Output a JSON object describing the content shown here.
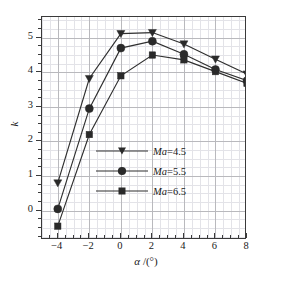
{
  "chart_data": {
    "type": "line",
    "title": "",
    "xlabel": "α /(°)",
    "ylabel": "k",
    "xlim": [
      -5,
      8
    ],
    "ylim": [
      -0.85,
      5.6
    ],
    "xticks": [
      -4,
      -2,
      0,
      2,
      4,
      6,
      8
    ],
    "xticklabels": [
      "−4",
      "−2",
      "0",
      "2",
      "4",
      "6",
      "8"
    ],
    "yticks": [
      0,
      1,
      2,
      3,
      4,
      5
    ],
    "yticklabels": [
      "0",
      "1",
      "2",
      "3",
      "4",
      "5"
    ],
    "grid": true,
    "minor_grid": true,
    "legend_position": "center-right",
    "x": [
      -4,
      -2,
      0,
      2,
      4,
      6,
      8
    ],
    "series": [
      {
        "name": "Ma=4.5",
        "label_prefix": "Ma",
        "label_value": "=4.5",
        "marker": "triangle-down",
        "values": [
          0.8,
          3.82,
          5.12,
          5.15,
          4.82,
          4.38,
          3.95
        ]
      },
      {
        "name": "Ma=5.5",
        "label_prefix": "Ma",
        "label_value": "=5.5",
        "marker": "circle",
        "values": [
          0.05,
          2.95,
          4.7,
          4.9,
          4.52,
          4.08,
          3.76
        ]
      },
      {
        "name": "Ma=6.5",
        "label_prefix": "Ma",
        "label_value": "=6.5",
        "marker": "square",
        "values": [
          -0.45,
          2.2,
          3.9,
          4.5,
          4.36,
          4.02,
          3.68
        ]
      }
    ],
    "colors": {
      "line": "#2f2f2f",
      "marker": "#2a2a2a",
      "axis": "#3a3a3a",
      "grid_major": "#b9b9bd",
      "grid_minor": "#e3e3e8"
    }
  },
  "axes": {
    "x_title_symbol": "α",
    "x_title_rest": " /(°)",
    "y_title": "k"
  }
}
